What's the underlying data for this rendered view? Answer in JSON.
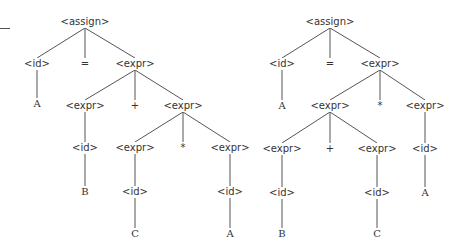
{
  "diagram": {
    "type": "parse-trees",
    "edge_color": "#555555",
    "trees": [
      {
        "name": "left-tree",
        "nodes": [
          {
            "id": "a",
            "label": "<assign>",
            "x": 85,
            "y": 22
          },
          {
            "id": "b",
            "label": "<id>",
            "x": 37,
            "y": 64
          },
          {
            "id": "c",
            "label": "=",
            "x": 85,
            "y": 64
          },
          {
            "id": "d",
            "label": "<expr>",
            "x": 135,
            "y": 64
          },
          {
            "id": "e",
            "label": "A",
            "x": 37,
            "y": 104,
            "terminal": true
          },
          {
            "id": "f",
            "label": "<expr>",
            "x": 85,
            "y": 106
          },
          {
            "id": "g",
            "label": "+",
            "x": 135,
            "y": 106
          },
          {
            "id": "h",
            "label": "<expr>",
            "x": 183,
            "y": 106
          },
          {
            "id": "i",
            "label": "<id>",
            "x": 85,
            "y": 148
          },
          {
            "id": "j",
            "label": "<expr>",
            "x": 135,
            "y": 148
          },
          {
            "id": "k",
            "label": "*",
            "x": 183,
            "y": 148
          },
          {
            "id": "l",
            "label": "<expr>",
            "x": 230,
            "y": 148
          },
          {
            "id": "m",
            "label": "B",
            "x": 85,
            "y": 192,
            "terminal": true
          },
          {
            "id": "n",
            "label": "<id>",
            "x": 135,
            "y": 192
          },
          {
            "id": "o",
            "label": "<id>",
            "x": 230,
            "y": 192
          },
          {
            "id": "p",
            "label": "C",
            "x": 135,
            "y": 234,
            "terminal": true
          },
          {
            "id": "q",
            "label": "A",
            "x": 230,
            "y": 234,
            "terminal": true
          }
        ],
        "edges": [
          [
            "a",
            "b"
          ],
          [
            "a",
            "c"
          ],
          [
            "a",
            "d"
          ],
          [
            "b",
            "e"
          ],
          [
            "d",
            "f"
          ],
          [
            "d",
            "g"
          ],
          [
            "d",
            "h"
          ],
          [
            "f",
            "i"
          ],
          [
            "h",
            "j"
          ],
          [
            "h",
            "k"
          ],
          [
            "h",
            "l"
          ],
          [
            "i",
            "m"
          ],
          [
            "j",
            "n"
          ],
          [
            "l",
            "o"
          ],
          [
            "n",
            "p"
          ],
          [
            "o",
            "q"
          ]
        ]
      },
      {
        "name": "right-tree",
        "nodes": [
          {
            "id": "a",
            "label": "<assign>",
            "x": 330,
            "y": 22
          },
          {
            "id": "b",
            "label": "<id>",
            "x": 282,
            "y": 64
          },
          {
            "id": "c",
            "label": "=",
            "x": 330,
            "y": 64
          },
          {
            "id": "d",
            "label": "<expr>",
            "x": 380,
            "y": 64
          },
          {
            "id": "e",
            "label": "A",
            "x": 282,
            "y": 106,
            "terminal": true
          },
          {
            "id": "f",
            "label": "<expr>",
            "x": 330,
            "y": 106
          },
          {
            "id": "g",
            "label": "*",
            "x": 380,
            "y": 106
          },
          {
            "id": "h",
            "label": "<expr>",
            "x": 425,
            "y": 106
          },
          {
            "id": "i",
            "label": "<expr>",
            "x": 282,
            "y": 149
          },
          {
            "id": "j",
            "label": "+",
            "x": 330,
            "y": 149
          },
          {
            "id": "k",
            "label": "<expr>",
            "x": 377,
            "y": 149
          },
          {
            "id": "l",
            "label": "<id>",
            "x": 425,
            "y": 149
          },
          {
            "id": "m",
            "label": "<id>",
            "x": 282,
            "y": 193
          },
          {
            "id": "n",
            "label": "<id>",
            "x": 377,
            "y": 193
          },
          {
            "id": "o",
            "label": "A",
            "x": 425,
            "y": 193,
            "terminal": true
          },
          {
            "id": "p",
            "label": "B",
            "x": 282,
            "y": 234,
            "terminal": true
          },
          {
            "id": "q",
            "label": "C",
            "x": 377,
            "y": 234,
            "terminal": true
          }
        ],
        "edges": [
          [
            "a",
            "b"
          ],
          [
            "a",
            "c"
          ],
          [
            "a",
            "d"
          ],
          [
            "b",
            "e"
          ],
          [
            "d",
            "f"
          ],
          [
            "d",
            "g"
          ],
          [
            "d",
            "h"
          ],
          [
            "f",
            "i"
          ],
          [
            "f",
            "j"
          ],
          [
            "f",
            "k"
          ],
          [
            "h",
            "l"
          ],
          [
            "i",
            "m"
          ],
          [
            "k",
            "n"
          ],
          [
            "l",
            "o"
          ],
          [
            "m",
            "p"
          ],
          [
            "n",
            "q"
          ]
        ]
      }
    ]
  }
}
